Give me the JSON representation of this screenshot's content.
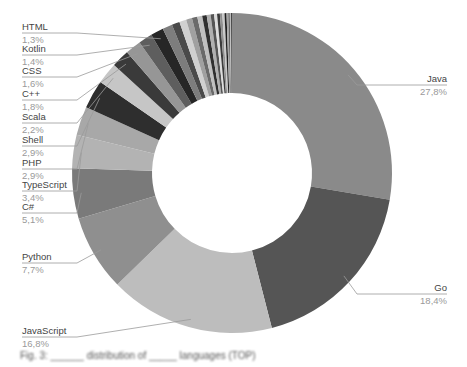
{
  "chart_data": {
    "type": "pie",
    "subtype": "donut",
    "title": "",
    "start_angle_deg": 0,
    "direction": "clockwise",
    "center": [
      232,
      173
    ],
    "outer_radius": 160,
    "inner_radius": 80,
    "series": [
      {
        "name": "Java",
        "value": 27.8,
        "label": "27,8%",
        "color": "#8a8a8a",
        "side": "right",
        "lx": 447,
        "ly": 82
      },
      {
        "name": "Go",
        "value": 18.4,
        "label": "18,4%",
        "color": "#555555",
        "side": "right",
        "lx": 447,
        "ly": 291
      },
      {
        "name": "JavaScript",
        "value": 16.8,
        "label": "16,8%",
        "color": "#bdbdbd",
        "side": "left",
        "lx": 22,
        "ly": 334
      },
      {
        "name": "Python",
        "value": 7.7,
        "label": "7,7%",
        "color": "#8f8f8f",
        "side": "left",
        "lx": 22,
        "ly": 260
      },
      {
        "name": "C#",
        "value": 5.1,
        "label": "5,1%",
        "color": "#7a7a7a",
        "side": "left",
        "lx": 22,
        "ly": 210
      },
      {
        "name": "TypeScript",
        "value": 3.4,
        "label": "3,4%",
        "color": "#b3b3b3",
        "side": "left",
        "lx": 22,
        "ly": 188
      },
      {
        "name": "PHP",
        "value": 2.9,
        "label": "2,9%",
        "color": "#a8a8a8",
        "side": "left",
        "lx": 22,
        "ly": 166
      },
      {
        "name": "Shell",
        "value": 2.9,
        "label": "2,9%",
        "color": "#2e2e2e",
        "side": "left",
        "lx": 22,
        "ly": 143
      },
      {
        "name": "Scala",
        "value": 2.2,
        "label": "2,2%",
        "color": "#c6c6c6",
        "side": "left",
        "lx": 22,
        "ly": 120
      },
      {
        "name": "C++",
        "value": 1.8,
        "label": "1,8%",
        "color": "#3a3a3a",
        "side": "left",
        "lx": 22,
        "ly": 97
      },
      {
        "name": "CSS",
        "value": 1.6,
        "label": "1,6%",
        "color": "#969696",
        "side": "left",
        "lx": 22,
        "ly": 74
      },
      {
        "name": "Kotlin",
        "value": 1.4,
        "label": "1,4%",
        "color": "#5e5e5e",
        "side": "left",
        "lx": 22,
        "ly": 52
      },
      {
        "name": "HTML",
        "value": 1.3,
        "label": "1,3%",
        "color": "#262626",
        "side": "left",
        "lx": 22,
        "ly": 30
      }
    ],
    "other_slices": [
      {
        "value": 1.0,
        "color": "#7d7d7d"
      },
      {
        "value": 0.8,
        "color": "#4a4a4a"
      },
      {
        "value": 0.7,
        "color": "#d0d0d0"
      },
      {
        "value": 0.6,
        "color": "#a0a0a0"
      },
      {
        "value": 0.55,
        "color": "#6a6a6a"
      },
      {
        "value": 0.5,
        "color": "#c0c0c0"
      },
      {
        "value": 0.45,
        "color": "#303030"
      },
      {
        "value": 0.4,
        "color": "#b0b0b0"
      },
      {
        "value": 0.35,
        "color": "#555555"
      },
      {
        "value": 0.3,
        "color": "#dddddd"
      },
      {
        "value": 0.28,
        "color": "#3c3c3c"
      },
      {
        "value": 0.25,
        "color": "#909090"
      },
      {
        "value": 0.22,
        "color": "#c8c8c8"
      },
      {
        "value": 0.2,
        "color": "#202020"
      },
      {
        "value": 0.18,
        "color": "#a5a5a5"
      },
      {
        "value": 0.15,
        "color": "#666666"
      },
      {
        "value": 0.12,
        "color": "#bbbbbb"
      },
      {
        "value": 0.1,
        "color": "#444444"
      }
    ],
    "legend": "none",
    "label_style": "leader-lines"
  },
  "caption": {
    "text": "Fig. 3: ______ distribution of _____ languages (TOP)",
    "legible": false
  }
}
